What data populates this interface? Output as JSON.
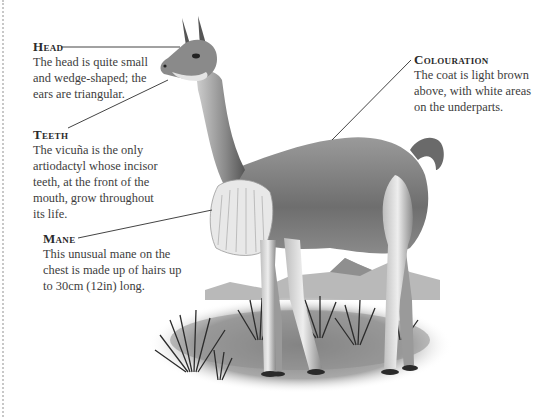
{
  "labels": {
    "head": {
      "title": "Head",
      "lines": [
        "The head is quite small",
        "and wedge-shaped; the",
        "ears are triangular."
      ]
    },
    "teeth": {
      "title": "Teeth",
      "lines": [
        "The vicuña is the only",
        "artiodactyl whose incisor",
        "teeth, at the front of the",
        "mouth, grow throughout",
        "its life."
      ]
    },
    "mane": {
      "title": "Mane",
      "lines": [
        "This unusual mane on the",
        "chest is made up of hairs up",
        "to 30cm (12in) long."
      ]
    },
    "colouration": {
      "title": "Colouration",
      "lines": [
        "The coat is light brown",
        "above, with white areas",
        "on the underparts."
      ]
    }
  },
  "colors": {
    "text": "#3d3d3d",
    "heading": "#2a2a2a",
    "leader_line": "#444444",
    "border": "#c8c8c8"
  }
}
